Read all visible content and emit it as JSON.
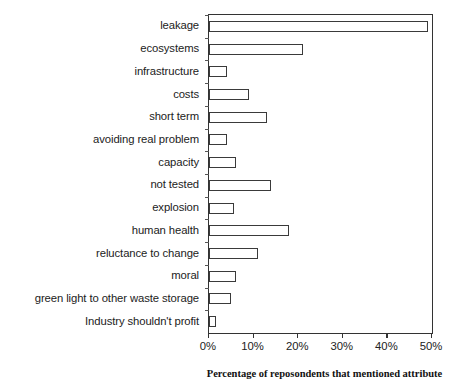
{
  "chart_data": {
    "type": "bar",
    "orientation": "horizontal",
    "title": "",
    "xlabel": "Percentage of reposondents that mentioned attribute",
    "ylabel": "Negative attribute",
    "categories": [
      "leakage",
      "ecosystems",
      "infrastructure",
      "costs",
      "short term",
      "avoiding real problem",
      "capacity",
      "not tested",
      "explosion",
      "human health",
      "reluctance to change",
      "moral",
      "green light to other waste storage",
      "Industry shouldn't profit"
    ],
    "values": [
      49,
      21,
      4,
      9,
      13,
      4,
      6,
      14,
      5.5,
      18,
      11,
      6,
      5,
      1.5
    ],
    "xlim": [
      0,
      50
    ],
    "xticks": [
      0,
      10,
      20,
      30,
      40,
      50
    ],
    "xtick_labels": [
      "0%",
      "10%",
      "20%",
      "30%",
      "40%",
      "50%"
    ],
    "grid": false,
    "legend": false,
    "bar_fill_color": "#ffffff",
    "bar_edge_color": "#3a3a3a",
    "axis_color": "#333333",
    "background_color": "#ffffff"
  },
  "figure": {
    "clipped_top_text": "",
    "y_axis_title": "Negative attribute",
    "x_axis_title": "Percentage of reposondents that mentioned attribute"
  }
}
